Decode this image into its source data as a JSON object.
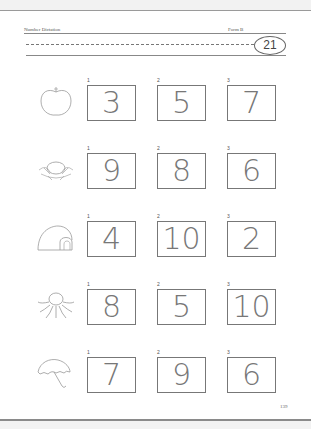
{
  "header": {
    "title": "Number Dictation",
    "form": "Form B",
    "badge_number": "21"
  },
  "rows": [
    {
      "picture": "apple",
      "items": [
        {
          "label": "1",
          "value": "3"
        },
        {
          "label": "2",
          "value": "5"
        },
        {
          "label": "3",
          "value": "7"
        }
      ]
    },
    {
      "picture": "nest-with-egg",
      "items": [
        {
          "label": "1",
          "value": "9"
        },
        {
          "label": "2",
          "value": "8"
        },
        {
          "label": "3",
          "value": "6"
        }
      ]
    },
    {
      "picture": "igloo",
      "items": [
        {
          "label": "1",
          "value": "4"
        },
        {
          "label": "2",
          "value": "10"
        },
        {
          "label": "3",
          "value": "2"
        }
      ]
    },
    {
      "picture": "octopus",
      "items": [
        {
          "label": "1",
          "value": "8"
        },
        {
          "label": "2",
          "value": "5"
        },
        {
          "label": "3",
          "value": "10"
        }
      ]
    },
    {
      "picture": "umbrella",
      "items": [
        {
          "label": "1",
          "value": "7"
        },
        {
          "label": "2",
          "value": "9"
        },
        {
          "label": "3",
          "value": "6"
        }
      ]
    }
  ],
  "footer": {
    "page_number": "139"
  }
}
